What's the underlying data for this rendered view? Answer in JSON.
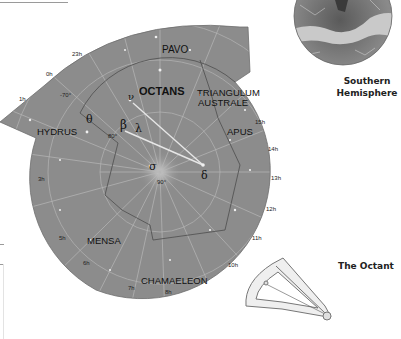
{
  "map": {
    "constellations": [
      {
        "name": "PAVO"
      },
      {
        "name": "OCTANS"
      },
      {
        "name": "TRIANGULUM"
      },
      {
        "name": "AUSTRALE"
      },
      {
        "name": "HYDRUS"
      },
      {
        "name": "APUS"
      },
      {
        "name": "MENSA"
      },
      {
        "name": "CHAMAELEON"
      }
    ],
    "hour_labels": [
      "23h",
      "0h",
      "1h",
      "3h",
      "5h",
      "6h",
      "7h",
      "8h",
      "10h",
      "11h",
      "12h",
      "13h",
      "14h",
      "15h"
    ],
    "declination_labels": [
      "-70°",
      "80°",
      "90°"
    ],
    "star_labels": [
      "ν",
      "θ",
      "β",
      "λ",
      "σ",
      "δ"
    ],
    "colors": {
      "map_fill": "#8c8c8c",
      "grid_line": "#b8b8b8",
      "boundary": "#555555",
      "label": "#111111",
      "pointer": "#e6e6e6"
    }
  },
  "captions": {
    "hemisphere_line1": "Southern",
    "hemisphere_line2": "Hemisphere",
    "octant": "The Octant"
  }
}
